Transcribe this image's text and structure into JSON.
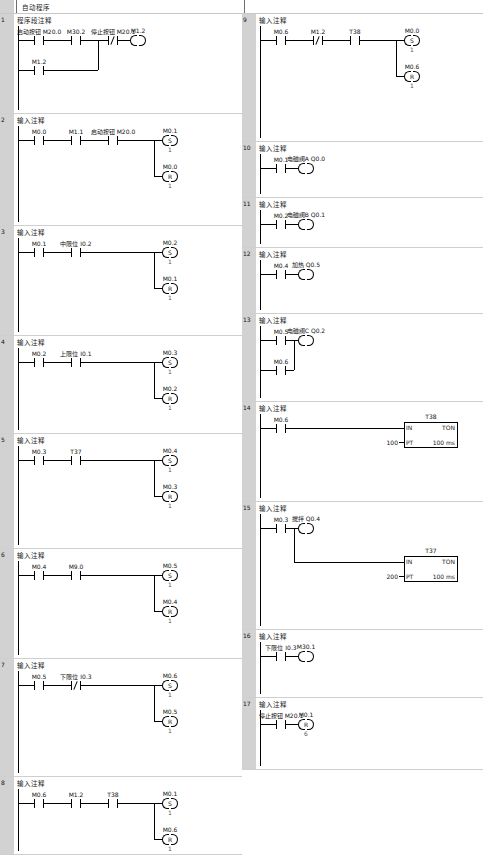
{
  "pou": {
    "title": "自动程序",
    "first_comment": "程序段注释",
    "default_comment": "输入注释"
  },
  "labels": {
    "set": "S",
    "reset": "R",
    "in": "IN",
    "ton": "TON",
    "pt": "PT",
    "timebase": "100 ms"
  },
  "networks": [
    {
      "num": "1",
      "comment": "程序段注释",
      "contacts": [
        {
          "name": "启动按钮 M20.0",
          "type": "no"
        },
        {
          "name": "M30.2",
          "type": "no"
        },
        {
          "name": "停止按钮 M20.1",
          "type": "nc"
        }
      ],
      "branch_contacts": [
        {
          "name": "M1.2",
          "type": "no"
        }
      ],
      "coils": [
        {
          "name": "M1.2",
          "type": "plain",
          "count": ""
        }
      ]
    },
    {
      "num": "2",
      "comment": "输入注释",
      "contacts": [
        {
          "name": "M0.0",
          "type": "no"
        },
        {
          "name": "M1.1",
          "type": "no"
        },
        {
          "name": "启动按钮 M20.0",
          "type": "no"
        }
      ],
      "coils": [
        {
          "name": "M0.1",
          "type": "S",
          "count": "1"
        },
        {
          "name": "M0.0",
          "type": "R",
          "count": "1"
        }
      ]
    },
    {
      "num": "3",
      "comment": "输入注释",
      "contacts": [
        {
          "name": "M0.1",
          "type": "no"
        },
        {
          "name": "中限位 I0.2",
          "type": "no"
        }
      ],
      "coils": [
        {
          "name": "M0.2",
          "type": "S",
          "count": "1"
        },
        {
          "name": "M0.1",
          "type": "R",
          "count": "1"
        }
      ]
    },
    {
      "num": "4",
      "comment": "输入注释",
      "contacts": [
        {
          "name": "M0.2",
          "type": "no"
        },
        {
          "name": "上限位 I0.1",
          "type": "no"
        }
      ],
      "coils": [
        {
          "name": "M0.3",
          "type": "S",
          "count": "1"
        },
        {
          "name": "M0.2",
          "type": "R",
          "count": "1"
        }
      ]
    },
    {
      "num": "5",
      "comment": "输入注释",
      "contacts": [
        {
          "name": "M0.3",
          "type": "no"
        },
        {
          "name": "T37",
          "type": "no"
        }
      ],
      "coils": [
        {
          "name": "M0.4",
          "type": "S",
          "count": "1"
        },
        {
          "name": "M0.3",
          "type": "R",
          "count": "1"
        }
      ]
    },
    {
      "num": "6",
      "comment": "输入注释",
      "contacts": [
        {
          "name": "M0.4",
          "type": "no"
        },
        {
          "name": "M9.0",
          "type": "no"
        }
      ],
      "coils": [
        {
          "name": "M0.5",
          "type": "S",
          "count": "1"
        },
        {
          "name": "M0.4",
          "type": "R",
          "count": "1"
        }
      ]
    },
    {
      "num": "7",
      "comment": "输入注释",
      "contacts": [
        {
          "name": "M0.5",
          "type": "no"
        },
        {
          "name": "下限位 I0.3",
          "type": "nc"
        }
      ],
      "coils": [
        {
          "name": "M0.6",
          "type": "S",
          "count": "1"
        },
        {
          "name": "M0.5",
          "type": "R",
          "count": "1"
        }
      ]
    },
    {
      "num": "8",
      "comment": "输入注释",
      "contacts": [
        {
          "name": "M0.6",
          "type": "no"
        },
        {
          "name": "M1.2",
          "type": "no"
        },
        {
          "name": "T38",
          "type": "no"
        }
      ],
      "coils": [
        {
          "name": "M0.1",
          "type": "S",
          "count": "1"
        },
        {
          "name": "M0.6",
          "type": "R",
          "count": "1"
        }
      ]
    },
    {
      "num": "9",
      "comment": "输入注释",
      "contacts": [
        {
          "name": "M0.6",
          "type": "no"
        },
        {
          "name": "M1.2",
          "type": "nc"
        },
        {
          "name": "T38",
          "type": "no"
        }
      ],
      "coils": [
        {
          "name": "M0.0",
          "type": "S",
          "count": "1"
        },
        {
          "name": "M0.6",
          "type": "R",
          "count": "1"
        }
      ]
    },
    {
      "num": "10",
      "comment": "输入注释",
      "contacts": [
        {
          "name": "M0.1",
          "type": "no"
        }
      ],
      "coils": [
        {
          "name": "电磁阀A Q0.0",
          "type": "plain",
          "count": ""
        }
      ]
    },
    {
      "num": "11",
      "comment": "输入注释",
      "contacts": [
        {
          "name": "M0.2",
          "type": "no"
        }
      ],
      "coils": [
        {
          "name": "电磁阀B Q0.1",
          "type": "plain",
          "count": ""
        }
      ]
    },
    {
      "num": "12",
      "comment": "输入注释",
      "contacts": [
        {
          "name": "M0.4",
          "type": "no"
        }
      ],
      "coils": [
        {
          "name": "加热 Q0.5",
          "type": "plain",
          "count": ""
        }
      ]
    },
    {
      "num": "13",
      "comment": "输入注释",
      "contacts": [
        {
          "name": "M0.5",
          "type": "no"
        }
      ],
      "branch_contacts": [
        {
          "name": "M0.6",
          "type": "no"
        }
      ],
      "coils": [
        {
          "name": "电磁阀C Q0.2",
          "type": "plain",
          "count": ""
        }
      ]
    },
    {
      "num": "14",
      "comment": "输入注释",
      "contacts": [
        {
          "name": "M0.6",
          "type": "no"
        }
      ],
      "timer": {
        "name": "T38",
        "instr": "TON",
        "pt": "100",
        "timebase": "100 ms"
      }
    },
    {
      "num": "15",
      "comment": "输入注释",
      "contacts": [
        {
          "name": "M0.3",
          "type": "no"
        }
      ],
      "coils": [
        {
          "name": "搅拌 Q0.4",
          "type": "plain",
          "count": ""
        }
      ],
      "timer": {
        "name": "T37",
        "instr": "TON",
        "pt": "200",
        "timebase": "100 ms"
      }
    },
    {
      "num": "16",
      "comment": "输入注释",
      "contacts": [
        {
          "name": "下限位 I0.3",
          "type": "no"
        }
      ],
      "coils": [
        {
          "name": "M30.1",
          "type": "plain",
          "count": ""
        }
      ]
    },
    {
      "num": "17",
      "comment": "输入注释",
      "contacts": [
        {
          "name": "停止按钮 M20.1",
          "type": "no"
        }
      ],
      "coils": [
        {
          "name": "M0.1",
          "type": "R",
          "count": "6"
        }
      ]
    }
  ]
}
